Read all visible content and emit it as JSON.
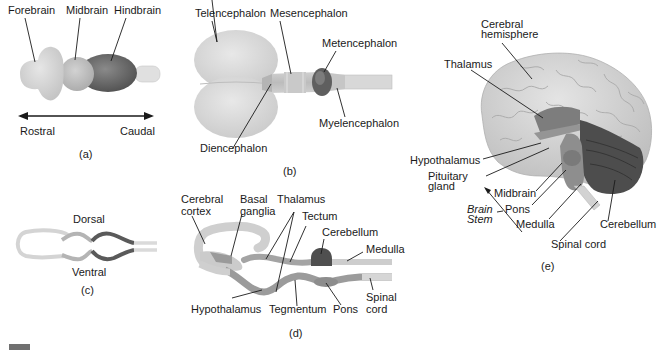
{
  "panels": {
    "a": {
      "caption": "(a)",
      "labels": {
        "forebrain": "Forebrain",
        "midbrain": "Midbrain",
        "hindbrain": "Hindbrain"
      },
      "axis": {
        "rostral": "Rostral",
        "caudal": "Caudal"
      }
    },
    "b": {
      "caption": "(b)",
      "labels": {
        "telencephalon": "Telencephalon",
        "mesencephalon": "Mesencephalon",
        "metencephalon": "Metencephalon",
        "myelencephalon": "Myelencephalon",
        "diencephalon": "Diencephalon"
      }
    },
    "c": {
      "caption": "(c)",
      "labels": {
        "dorsal": "Dorsal",
        "ventral": "Ventral"
      }
    },
    "d": {
      "caption": "(d)",
      "labels": {
        "cerebral_cortex_1": "Cerebral",
        "cerebral_cortex_2": "cortex",
        "basal_ganglia_1": "Basal",
        "basal_ganglia_2": "ganglia",
        "thalamus": "Thalamus",
        "tectum": "Tectum",
        "cerebellum": "Cerebellum",
        "medulla": "Medulla",
        "hypothalamus": "Hypothalamus",
        "tegmentum": "Tegmentum",
        "pons": "Pons",
        "spinal_cord_1": "Spinal",
        "spinal_cord_2": "cord"
      }
    },
    "e": {
      "caption": "(e)",
      "labels": {
        "cerebral_hemisphere_1": "Cerebral",
        "cerebral_hemisphere_2": "hemisphere",
        "thalamus": "Thalamus",
        "hypothalamus": "Hypothalamus",
        "pituitary_1": "Pituitary",
        "pituitary_2": "gland",
        "midbrain": "Midbrain",
        "pons": "Pons",
        "medulla": "Medulla",
        "brain_stem_1": "Brain",
        "brain_stem_2": "Stem",
        "cerebellum": "Cerebellum",
        "spinal_cord": "Spinal cord"
      }
    }
  },
  "colors": {
    "forebrain": "#d6d6d6",
    "midbrain": "#bdbdbd",
    "hindbrain": "#6f6f6f",
    "cord": "#e2e2e2",
    "cortex_brain": "#d0d0d0",
    "thalamus_dark": "#7a7a7a",
    "cerebellum_dark": "#5a5a5a",
    "ink": "#1a1a1a"
  }
}
